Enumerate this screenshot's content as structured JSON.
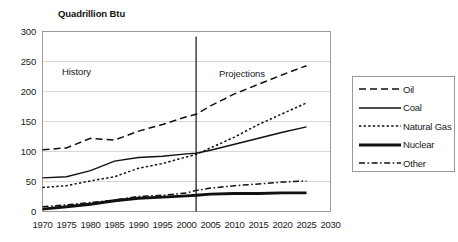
{
  "chart_data": {
    "type": "line",
    "title": "Quadrillion Btu",
    "xlabel": "",
    "ylabel": "Quadrillion Btu",
    "xlim": [
      1970,
      2030
    ],
    "ylim": [
      0,
      300
    ],
    "grid": true,
    "legend_position": "right",
    "x_ticks": [
      "1970",
      "1975",
      "1980",
      "1985",
      "1990",
      "1995",
      "2000",
      "2005",
      "2010",
      "2015",
      "2020",
      "2025",
      "2030"
    ],
    "y_ticks": [
      "0",
      "50",
      "100",
      "150",
      "200",
      "250",
      "300"
    ],
    "annotations": [
      {
        "text": "History",
        "x": 1979,
        "y": 232
      },
      {
        "text": "Projections",
        "x": 2009,
        "y": 228
      }
    ],
    "divider_x": 2002,
    "x": [
      1970,
      1975,
      1980,
      1985,
      1990,
      1995,
      2000,
      2002,
      2005,
      2010,
      2015,
      2020,
      2025
    ],
    "series": [
      {
        "name": "Oil",
        "style": "long-dash",
        "color": "#111111",
        "values": [
          103,
          106,
          122,
          119,
          134,
          145,
          158,
          162,
          176,
          196,
          212,
          228,
          243
        ]
      },
      {
        "name": "Coal",
        "style": "solid-thin",
        "color": "#111111",
        "values": [
          56,
          58,
          68,
          84,
          90,
          92,
          96,
          97,
          102,
          112,
          122,
          132,
          141
        ]
      },
      {
        "name": "Natural Gas",
        "style": "dotted",
        "color": "#111111",
        "values": [
          40,
          43,
          51,
          58,
          72,
          80,
          91,
          95,
          106,
          124,
          145,
          163,
          181
        ]
      },
      {
        "name": "Nuclear",
        "style": "solid-thick",
        "color": "#111111",
        "values": [
          4,
          8,
          12,
          18,
          22,
          24,
          26,
          27,
          29,
          30,
          30,
          31,
          31
        ]
      },
      {
        "name": "Other",
        "style": "dash-dot",
        "color": "#111111",
        "values": [
          8,
          11,
          15,
          19,
          25,
          27,
          31,
          35,
          39,
          43,
          46,
          49,
          51
        ]
      }
    ]
  },
  "legend": {
    "items": [
      {
        "label": "Oil"
      },
      {
        "label": "Coal"
      },
      {
        "label": "Natural Gas"
      },
      {
        "label": "Nuclear"
      },
      {
        "label": "Other"
      }
    ]
  }
}
